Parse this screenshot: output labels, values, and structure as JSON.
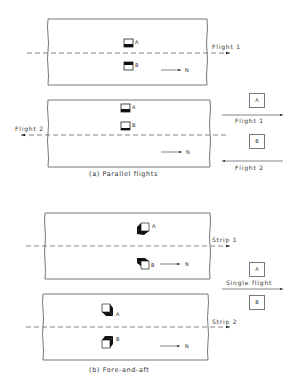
{
  "figure": {
    "part_a": {
      "caption": "(a) Parallel flights",
      "strip_top": {
        "flight_label": "Flight 1",
        "photo_labels": [
          "A",
          "B"
        ],
        "north_label": "N"
      },
      "strip_bottom": {
        "flight_label": "Flight 2",
        "photo_labels": [
          "A",
          "B"
        ],
        "north_label": "N"
      },
      "legend": {
        "box_a": "A",
        "arrow_1_label": "Flight 1",
        "box_b": "B",
        "arrow_2_label": "Flight 2"
      }
    },
    "part_b": {
      "caption": "(b) Fore-and-aft",
      "strip_top": {
        "strip_label": "Strip 1",
        "photo_labels": [
          "A",
          "B"
        ],
        "north_label": "N"
      },
      "strip_bottom": {
        "strip_label": "Strip 2",
        "photo_labels": [
          "A",
          "B"
        ],
        "north_label": "N"
      },
      "legend": {
        "box_a": "A",
        "arrow_label": "Single flight",
        "box_b": "B"
      }
    }
  }
}
